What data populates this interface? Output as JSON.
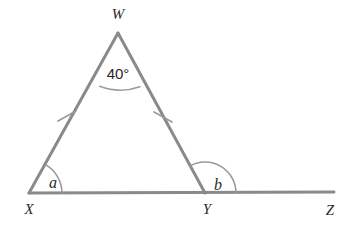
{
  "figure": {
    "kind": "euclidean-geometry-diagram",
    "background_color": "#ffffff",
    "stroke_color": "#8a8a8a",
    "arc_color": "#9a9a9a",
    "label_color": "#2b2b2b"
  },
  "vertices": [
    {
      "id": "W",
      "label": "W",
      "x": 118,
      "y": 33,
      "label_x": 118,
      "label_y": 19
    },
    {
      "id": "X",
      "label": "X",
      "x": 29,
      "y": 193,
      "label_x": 29,
      "label_y": 214
    },
    {
      "id": "Y",
      "label": "Y",
      "x": 205,
      "y": 193,
      "label_x": 207,
      "label_y": 214
    },
    {
      "id": "Z",
      "label": "Z",
      "x": 334,
      "y": 192,
      "label_x": 330,
      "label_y": 215
    }
  ],
  "segments": [
    {
      "name": "WX",
      "from": "W",
      "to": "X",
      "tick_marks": 1
    },
    {
      "name": "WY",
      "from": "W",
      "to": "Y",
      "tick_marks": 1
    },
    {
      "name": "XZ",
      "from": "X",
      "to": "Z",
      "tick_marks": 0
    }
  ],
  "tick_marks": [
    {
      "on_segment": "WX",
      "x": 67,
      "y": 116
    },
    {
      "on_segment": "WY",
      "x": 163,
      "y": 117
    }
  ],
  "angles": [
    {
      "id": "angle-w",
      "at_vertex": "W",
      "label": "40°",
      "value": 40,
      "unit": "degrees",
      "known": true,
      "label_x": 118,
      "label_y": 79,
      "arc_radius": 58
    },
    {
      "id": "angle-a",
      "at_vertex": "X",
      "label": "a",
      "value": null,
      "unit": "degrees",
      "known": false,
      "label_x": 53,
      "label_y": 188,
      "arc_radius": 33
    },
    {
      "id": "angle-b",
      "at_vertex": "Y",
      "label": "b",
      "value": null,
      "unit": "degrees",
      "known": false,
      "known_type": "exterior",
      "label_x": 218,
      "label_y": 190,
      "arc_radius": 31
    }
  ]
}
